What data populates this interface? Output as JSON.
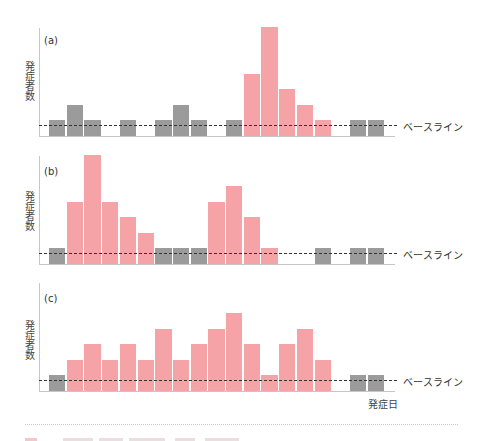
{
  "colors": {
    "baseline_bar": "#9b9b9b",
    "outbreak_bar": "#f5a3a6",
    "axis": "#c6c6c6",
    "baseline_line": "#333333",
    "separator": "#f0b6bf"
  },
  "xlabel": "発症日",
  "panels": [
    {
      "label": "(a)",
      "ylabel": "発症者数",
      "baseline_label": "ベースライン"
    },
    {
      "label": "(b)",
      "ylabel": "発症者数",
      "baseline_label": "ベースライン"
    },
    {
      "label": "(c)",
      "ylabel": "発症者数",
      "baseline_label": "ベースライン"
    }
  ],
  "chart_data": [
    {
      "type": "bar",
      "title": "(a)",
      "xlabel": "発症日",
      "ylabel": "発症者数",
      "x": [
        1,
        2,
        3,
        4,
        5,
        6,
        7,
        8,
        9,
        10,
        11,
        12,
        13,
        14,
        15,
        16,
        17,
        18,
        19
      ],
      "values": [
        1,
        2,
        1,
        0,
        1,
        0,
        1,
        2,
        1,
        0,
        1,
        4,
        7,
        3,
        2,
        1,
        0,
        1,
        1
      ],
      "bar_type": [
        "baseline",
        "baseline",
        "baseline",
        null,
        "baseline",
        null,
        "baseline",
        "baseline",
        "baseline",
        null,
        "baseline",
        "outbreak",
        "outbreak",
        "outbreak",
        "outbreak",
        "outbreak",
        null,
        "baseline",
        "baseline"
      ],
      "baseline_level": 0.65,
      "annotation": "ベースライン",
      "ylim": [
        0,
        7
      ],
      "grid": false
    },
    {
      "type": "bar",
      "title": "(b)",
      "xlabel": "発症日",
      "ylabel": "発症者数",
      "x": [
        1,
        2,
        3,
        4,
        5,
        6,
        7,
        8,
        9,
        10,
        11,
        12,
        13,
        14,
        15,
        16,
        17,
        18,
        19
      ],
      "values": [
        1,
        4,
        7,
        4,
        3,
        2,
        1,
        1,
        1,
        4,
        5,
        3,
        1,
        0,
        0,
        1,
        0,
        1,
        1
      ],
      "bar_type": [
        "baseline",
        "outbreak",
        "outbreak",
        "outbreak",
        "outbreak",
        "outbreak",
        "baseline",
        "baseline",
        "baseline",
        "outbreak",
        "outbreak",
        "outbreak",
        "outbreak",
        null,
        null,
        "baseline",
        null,
        "baseline",
        "baseline"
      ],
      "baseline_level": 0.65,
      "annotation": "ベースライン",
      "ylim": [
        0,
        7
      ],
      "grid": false
    },
    {
      "type": "bar",
      "title": "(c)",
      "xlabel": "発症日",
      "ylabel": "発症者数",
      "x": [
        1,
        2,
        3,
        4,
        5,
        6,
        7,
        8,
        9,
        10,
        11,
        12,
        13,
        14,
        15,
        16,
        17,
        18,
        19
      ],
      "values": [
        1,
        2,
        3,
        2,
        3,
        2,
        4,
        2,
        3,
        4,
        5,
        3,
        1,
        3,
        4,
        2,
        0,
        1,
        1
      ],
      "bar_type": [
        "baseline",
        "outbreak",
        "outbreak",
        "outbreak",
        "outbreak",
        "outbreak",
        "outbreak",
        "outbreak",
        "outbreak",
        "outbreak",
        "outbreak",
        "outbreak",
        "outbreak",
        "outbreak",
        "outbreak",
        "outbreak",
        null,
        "baseline",
        "baseline"
      ],
      "baseline_level": 0.65,
      "annotation": "ベースライン",
      "ylim": [
        0,
        7
      ],
      "grid": false
    }
  ]
}
